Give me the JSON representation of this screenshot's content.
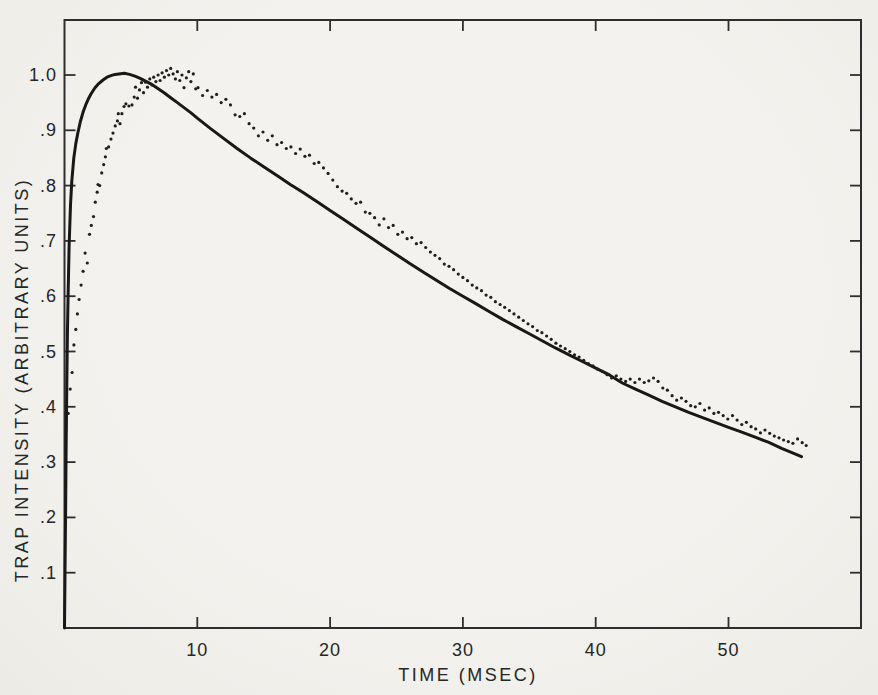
{
  "figure": {
    "colors": {
      "paper": "#f2f0ec",
      "ink": "#262626",
      "curve": "#181818",
      "dot": "#1f1f1f",
      "frame": "#2e2e2e"
    }
  },
  "chart_data": {
    "type": "scatter",
    "title": "",
    "xlabel": "TIME (MSEC)",
    "ylabel": "TRAP INTENSITY (ARBITRARY UNITS)",
    "xlim": [
      0,
      60
    ],
    "ylim": [
      0,
      1.1
    ],
    "grid": false,
    "frame": "full-box-with-mirrored-ticks",
    "x_ticks": [
      {
        "v": 10,
        "label": "10"
      },
      {
        "v": 20,
        "label": "20"
      },
      {
        "v": 30,
        "label": "30"
      },
      {
        "v": 40,
        "label": "40"
      },
      {
        "v": 50,
        "label": "50"
      }
    ],
    "y_ticks": [
      {
        "v": 1.0,
        "label": "1.0"
      },
      {
        "v": 0.9,
        "label": ".9"
      },
      {
        "v": 0.8,
        "label": ".8"
      },
      {
        "v": 0.7,
        "label": ".7"
      },
      {
        "v": 0.6,
        "label": ".6"
      },
      {
        "v": 0.5,
        "label": ".5"
      },
      {
        "v": 0.4,
        "label": ".4"
      },
      {
        "v": 0.3,
        "label": ".3"
      },
      {
        "v": 0.2,
        "label": ".2"
      },
      {
        "v": 0.1,
        "label": ".1"
      }
    ],
    "series": [
      {
        "name": "theoretical-curve",
        "style": "solid-line",
        "points": [
          [
            0,
            0
          ],
          [
            0.04,
            0.1
          ],
          [
            0.08,
            0.21
          ],
          [
            0.12,
            0.32
          ],
          [
            0.17,
            0.44
          ],
          [
            0.22,
            0.53
          ],
          [
            0.28,
            0.61
          ],
          [
            0.35,
            0.69
          ],
          [
            0.45,
            0.765
          ],
          [
            0.55,
            0.808
          ],
          [
            0.7,
            0.85
          ],
          [
            0.85,
            0.876
          ],
          [
            1.0,
            0.895
          ],
          [
            1.2,
            0.916
          ],
          [
            1.4,
            0.933
          ],
          [
            1.6,
            0.946
          ],
          [
            1.8,
            0.957
          ],
          [
            2.0,
            0.966
          ],
          [
            2.3,
            0.977
          ],
          [
            2.6,
            0.985
          ],
          [
            2.9,
            0.991
          ],
          [
            3.2,
            0.996
          ],
          [
            3.5,
            0.999
          ],
          [
            3.8,
            1.001
          ],
          [
            4.1,
            1.002
          ],
          [
            4.5,
            1.003
          ],
          [
            4.9,
            1.001
          ],
          [
            5.3,
            0.998
          ],
          [
            5.7,
            0.994
          ],
          [
            6.1,
            0.989
          ],
          [
            6.5,
            0.984
          ],
          [
            7.0,
            0.976
          ],
          [
            7.5,
            0.968
          ],
          [
            8.0,
            0.959
          ],
          [
            8.5,
            0.95
          ],
          [
            9.0,
            0.941
          ],
          [
            9.5,
            0.932
          ],
          [
            10,
            0.922
          ],
          [
            11,
            0.903
          ],
          [
            12,
            0.885
          ],
          [
            13,
            0.867
          ],
          [
            14,
            0.85
          ],
          [
            15,
            0.834
          ],
          [
            16,
            0.818
          ],
          [
            17,
            0.802
          ],
          [
            18,
            0.787
          ],
          [
            19,
            0.771
          ],
          [
            20,
            0.755
          ],
          [
            21,
            0.739
          ],
          [
            22,
            0.723
          ],
          [
            23,
            0.707
          ],
          [
            24,
            0.691
          ],
          [
            25,
            0.675
          ],
          [
            26,
            0.659
          ],
          [
            27,
            0.644
          ],
          [
            28,
            0.629
          ],
          [
            29,
            0.614
          ],
          [
            30,
            0.6
          ],
          [
            31,
            0.586
          ],
          [
            32,
            0.572
          ],
          [
            33,
            0.558
          ],
          [
            34,
            0.545
          ],
          [
            35,
            0.532
          ],
          [
            36,
            0.519
          ],
          [
            37,
            0.506
          ],
          [
            38,
            0.494
          ],
          [
            39,
            0.482
          ],
          [
            40,
            0.47
          ],
          [
            41,
            0.458
          ],
          [
            42,
            0.443
          ],
          [
            43,
            0.432
          ],
          [
            44,
            0.421
          ],
          [
            45,
            0.41
          ],
          [
            46,
            0.4
          ],
          [
            47,
            0.39
          ],
          [
            48,
            0.381
          ],
          [
            49,
            0.372
          ],
          [
            50,
            0.363
          ],
          [
            51,
            0.354
          ],
          [
            52,
            0.345
          ],
          [
            53,
            0.336
          ],
          [
            54,
            0.325
          ],
          [
            55,
            0.315
          ],
          [
            55.5,
            0.31
          ]
        ]
      },
      {
        "name": "experimental-data",
        "style": "dots",
        "points": [
          [
            0.28,
            0.388
          ],
          [
            0.43,
            0.432
          ],
          [
            0.57,
            0.462
          ],
          [
            0.71,
            0.512
          ],
          [
            0.85,
            0.54
          ],
          [
            0.97,
            0.568
          ],
          [
            1.1,
            0.594
          ],
          [
            1.25,
            0.62
          ],
          [
            1.4,
            0.645
          ],
          [
            1.55,
            0.678
          ],
          [
            1.72,
            0.66
          ],
          [
            1.88,
            0.712
          ],
          [
            2.02,
            0.728
          ],
          [
            2.18,
            0.744
          ],
          [
            2.32,
            0.77
          ],
          [
            2.46,
            0.788
          ],
          [
            2.52,
            0.802
          ],
          [
            2.65,
            0.8
          ],
          [
            2.8,
            0.823
          ],
          [
            2.95,
            0.838
          ],
          [
            3.08,
            0.852
          ],
          [
            3.15,
            0.867
          ],
          [
            3.32,
            0.87
          ],
          [
            3.5,
            0.884
          ],
          [
            3.65,
            0.895
          ],
          [
            3.82,
            0.908
          ],
          [
            3.98,
            0.917
          ],
          [
            4.05,
            0.93
          ],
          [
            4.18,
            0.912
          ],
          [
            4.32,
            0.93
          ],
          [
            4.48,
            0.943
          ],
          [
            4.62,
            0.948
          ],
          [
            4.85,
            0.944
          ],
          [
            5.08,
            0.946
          ],
          [
            5.25,
            0.96
          ],
          [
            5.35,
            0.978
          ],
          [
            5.5,
            0.958
          ],
          [
            5.65,
            0.973
          ],
          [
            5.8,
            0.986
          ],
          [
            5.95,
            0.968
          ],
          [
            6.1,
            0.987
          ],
          [
            6.25,
            0.978
          ],
          [
            6.42,
            0.993
          ],
          [
            6.58,
            0.982
          ],
          [
            6.72,
            0.996
          ],
          [
            6.88,
            0.988
          ],
          [
            7.05,
            1.0
          ],
          [
            7.2,
            0.99
          ],
          [
            7.35,
            1.004
          ],
          [
            7.52,
            0.996
          ],
          [
            7.68,
            1.008
          ],
          [
            7.85,
            1.0
          ],
          [
            8.0,
            1.012
          ],
          [
            8.18,
            1.002
          ],
          [
            8.35,
            0.993
          ],
          [
            8.5,
            1.006
          ],
          [
            8.68,
            0.99
          ],
          [
            8.85,
            1.0
          ],
          [
            9.0,
            0.977
          ],
          [
            9.18,
            0.995
          ],
          [
            9.35,
            1.006
          ],
          [
            9.52,
            0.988
          ],
          [
            9.7,
            1.002
          ],
          [
            9.88,
            0.975
          ],
          [
            10.05,
            0.977
          ],
          [
            10.4,
            0.963
          ],
          [
            10.75,
            0.972
          ],
          [
            11.1,
            0.96
          ],
          [
            11.45,
            0.965
          ],
          [
            11.8,
            0.95
          ],
          [
            12.15,
            0.956
          ],
          [
            12.5,
            0.946
          ],
          [
            12.85,
            0.928
          ],
          [
            13.2,
            0.925
          ],
          [
            13.55,
            0.93
          ],
          [
            13.9,
            0.912
          ],
          [
            14.25,
            0.904
          ],
          [
            14.6,
            0.89
          ],
          [
            14.95,
            0.897
          ],
          [
            15.3,
            0.882
          ],
          [
            15.65,
            0.89
          ],
          [
            16.0,
            0.874
          ],
          [
            16.35,
            0.878
          ],
          [
            16.7,
            0.867
          ],
          [
            17.05,
            0.87
          ],
          [
            17.4,
            0.858
          ],
          [
            17.75,
            0.866
          ],
          [
            18.1,
            0.853
          ],
          [
            18.45,
            0.855
          ],
          [
            18.8,
            0.84
          ],
          [
            19.15,
            0.842
          ],
          [
            19.5,
            0.832
          ],
          [
            19.85,
            0.822
          ],
          [
            20.2,
            0.81
          ],
          [
            20.55,
            0.798
          ],
          [
            20.9,
            0.79
          ],
          [
            21.25,
            0.786
          ],
          [
            21.6,
            0.776
          ],
          [
            21.95,
            0.768
          ],
          [
            22.3,
            0.77
          ],
          [
            22.65,
            0.752
          ],
          [
            23.0,
            0.75
          ],
          [
            23.35,
            0.742
          ],
          [
            23.7,
            0.729
          ],
          [
            24.05,
            0.74
          ],
          [
            24.4,
            0.724
          ],
          [
            24.75,
            0.728
          ],
          [
            25.1,
            0.712
          ],
          [
            25.45,
            0.716
          ],
          [
            25.8,
            0.704
          ],
          [
            26.15,
            0.706
          ],
          [
            26.5,
            0.695
          ],
          [
            26.85,
            0.697
          ],
          [
            27.2,
            0.688
          ],
          [
            27.55,
            0.68
          ],
          [
            27.9,
            0.674
          ],
          [
            28.25,
            0.668
          ],
          [
            28.6,
            0.658
          ],
          [
            28.95,
            0.654
          ],
          [
            29.3,
            0.648
          ],
          [
            29.65,
            0.64
          ],
          [
            30.0,
            0.634
          ],
          [
            30.35,
            0.628
          ],
          [
            30.7,
            0.62
          ],
          [
            31.05,
            0.615
          ],
          [
            31.4,
            0.61
          ],
          [
            31.75,
            0.602
          ],
          [
            32.1,
            0.598
          ],
          [
            32.45,
            0.59
          ],
          [
            32.8,
            0.585
          ],
          [
            33.15,
            0.58
          ],
          [
            33.5,
            0.574
          ],
          [
            33.85,
            0.568
          ],
          [
            34.2,
            0.562
          ],
          [
            34.55,
            0.556
          ],
          [
            34.9,
            0.55
          ],
          [
            35.25,
            0.545
          ],
          [
            35.6,
            0.538
          ],
          [
            35.95,
            0.534
          ],
          [
            36.3,
            0.528
          ],
          [
            36.65,
            0.522
          ],
          [
            37.0,
            0.515
          ],
          [
            37.35,
            0.51
          ],
          [
            37.7,
            0.505
          ],
          [
            38.05,
            0.5
          ],
          [
            38.4,
            0.494
          ],
          [
            38.75,
            0.49
          ],
          [
            39.1,
            0.484
          ],
          [
            39.45,
            0.478
          ],
          [
            39.8,
            0.474
          ],
          [
            40.15,
            0.468
          ],
          [
            40.5,
            0.464
          ],
          [
            40.85,
            0.458
          ],
          [
            41.2,
            0.452
          ],
          [
            41.55,
            0.456
          ],
          [
            41.9,
            0.45
          ],
          [
            42.25,
            0.446
          ],
          [
            42.6,
            0.45
          ],
          [
            42.95,
            0.444
          ],
          [
            43.3,
            0.45
          ],
          [
            43.65,
            0.444
          ],
          [
            44.0,
            0.447
          ],
          [
            44.35,
            0.452
          ],
          [
            44.7,
            0.446
          ],
          [
            45.05,
            0.434
          ],
          [
            45.4,
            0.43
          ],
          [
            45.75,
            0.42
          ],
          [
            46.1,
            0.412
          ],
          [
            46.45,
            0.416
          ],
          [
            46.8,
            0.41
          ],
          [
            47.15,
            0.402
          ],
          [
            47.5,
            0.4
          ],
          [
            47.85,
            0.406
          ],
          [
            48.2,
            0.394
          ],
          [
            48.55,
            0.398
          ],
          [
            48.9,
            0.388
          ],
          [
            49.25,
            0.39
          ],
          [
            49.6,
            0.384
          ],
          [
            49.95,
            0.378
          ],
          [
            50.3,
            0.384
          ],
          [
            50.65,
            0.376
          ],
          [
            51.0,
            0.368
          ],
          [
            51.35,
            0.372
          ],
          [
            51.7,
            0.364
          ],
          [
            52.05,
            0.36
          ],
          [
            52.4,
            0.353
          ],
          [
            52.75,
            0.358
          ],
          [
            53.1,
            0.352
          ],
          [
            53.45,
            0.347
          ],
          [
            53.8,
            0.344
          ],
          [
            54.15,
            0.34
          ],
          [
            54.5,
            0.337
          ],
          [
            54.85,
            0.334
          ],
          [
            55.2,
            0.342
          ],
          [
            55.55,
            0.335
          ],
          [
            55.85,
            0.33
          ]
        ]
      }
    ]
  }
}
